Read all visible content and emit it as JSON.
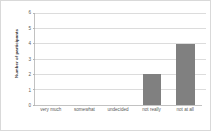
{
  "chart_data": {
    "type": "bar",
    "title": "",
    "xlabel": "",
    "ylabel": "Number of participants",
    "categories": [
      "very much",
      "somewhat",
      "undecided",
      "not really",
      "not at all"
    ],
    "values": [
      0,
      0,
      0,
      2,
      4
    ],
    "ylim": [
      0,
      6
    ],
    "yticks": [
      0,
      1,
      2,
      3,
      4,
      5,
      6
    ],
    "ytick_labels": [
      "0",
      "1",
      "2",
      "3",
      "4",
      "5",
      "6"
    ],
    "grid": true,
    "legend": false,
    "legend_position": "none",
    "colors": {
      "bar": "#808080",
      "gridline": "#dcdcdc",
      "axis": "#c2c2c2",
      "frame": "#d9d9d9",
      "background": "#ffffff",
      "tick_text": "#5a5a5a",
      "axis_title_text": "#3a3a3a"
    }
  }
}
